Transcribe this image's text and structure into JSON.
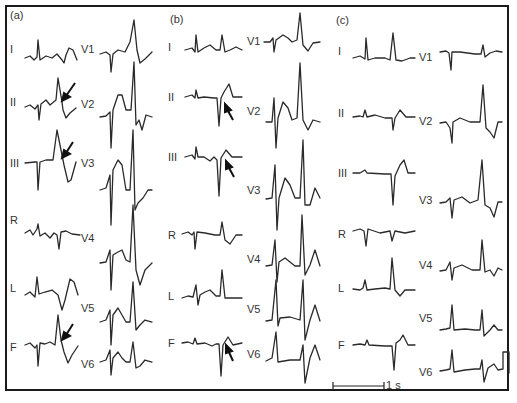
{
  "figure": {
    "panels": [
      {
        "id": "a",
        "label": "(a)",
        "limb_leads": [
          "I",
          "II",
          "III",
          "R",
          "L",
          "F"
        ],
        "chest_leads": [
          "V1",
          "V2",
          "V3",
          "V4",
          "V5",
          "V6"
        ],
        "arrows_on": [
          "II",
          "III",
          "F"
        ]
      },
      {
        "id": "b",
        "label": "(b)",
        "limb_leads": [
          "I",
          "II",
          "III",
          "R",
          "L",
          "F"
        ],
        "chest_leads": [
          "V1",
          "V2",
          "V3",
          "V4",
          "V5",
          "V6"
        ],
        "arrows_on": [
          "II",
          "III",
          "F"
        ]
      },
      {
        "id": "c",
        "label": "(c)",
        "limb_leads": [
          "I",
          "II",
          "III",
          "R",
          "L",
          "F"
        ],
        "chest_leads": [
          "V1",
          "V2",
          "V3",
          "V4",
          "V5",
          "V6"
        ],
        "arrows_on": []
      }
    ],
    "scale_bar": {
      "label": "1 s"
    }
  }
}
